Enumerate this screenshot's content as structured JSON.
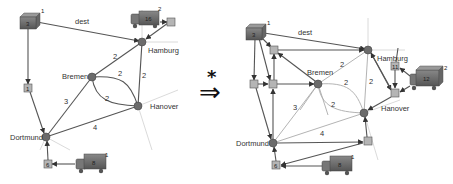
{
  "transform": {
    "arrow": "⇒",
    "star": "*"
  },
  "left": {
    "cities": {
      "hamburg": "Hamburg",
      "bremen": "Bremen",
      "hanover": "Hanover",
      "dortmund": "Dortmund"
    },
    "edge_labels": {
      "dest": "dest",
      "bremen_hamburg": "2",
      "hamburg_hanover": "2",
      "bremen_hanover_upper": "2",
      "bremen_hanover_lower": "2",
      "bremen_dortmund": "3",
      "dortmund_hanover": "4"
    },
    "depot": {
      "id": "3",
      "tag": "1"
    },
    "truck_top": {
      "id": "16",
      "tag": "2"
    },
    "box_top_right": {
      "id": "5"
    },
    "box_left": {
      "id": "1"
    },
    "box_bottom": {
      "id": "6"
    },
    "truck_bottom": {
      "id": "8",
      "tag": "1"
    }
  },
  "right": {
    "cities": {
      "hamburg": "Hamburg",
      "bremen": "Bremen",
      "hanover": "Hanover",
      "dortmund": "Dortmund"
    },
    "edge_labels": {
      "dest": "dest",
      "bremen_hamburg": "2",
      "hamburg_hanover": "2",
      "bremen_hanover_upper": "2",
      "bremen_hanover_lower": "2",
      "bremen_dortmund": "3",
      "dortmund_hanover": "4"
    },
    "depot": {
      "id": "3",
      "tag": "1"
    },
    "box_hamburg": {
      "id": "11"
    },
    "box_hanover": {
      "id": "5"
    },
    "truck_right": {
      "id": "12",
      "tag": "2"
    },
    "box_bottom": {
      "id": "6"
    },
    "truck_bottom": {
      "id": "8",
      "tag": "1"
    },
    "box_near_hanover": {
      "id": "7"
    }
  }
}
